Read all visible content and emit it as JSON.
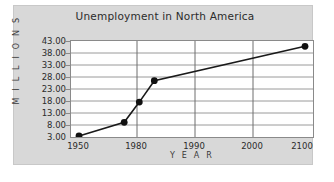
{
  "chart_data": {
    "type": "line",
    "title": "Unemployment in North America",
    "xlabel": "Y E A R",
    "ylabel": "M I L L I O N S",
    "x": [
      1950,
      1980,
      1990,
      2000,
      2100
    ],
    "xtick_labels": [
      "1950",
      "1980",
      "1990",
      "2000",
      "2100"
    ],
    "values": [
      3.2,
      9.0,
      17.5,
      26.5,
      41.0
    ],
    "ytick_labels": [
      "43.00",
      "38.00",
      "33.00",
      "28.00",
      "23.00",
      "18.00",
      "13.00",
      "8.00",
      "3.00"
    ],
    "yticks": [
      43.0,
      38.0,
      33.0,
      28.0,
      23.0,
      18.0,
      13.0,
      8.0,
      3.0
    ],
    "ylim": [
      3.0,
      43.0
    ],
    "grid": "horizontal-and-vertical",
    "legend": "none",
    "series_name": "Unemployment",
    "line_color": "#1a1a1a",
    "marker": "circle",
    "marker_color": "#111111",
    "background_color": "#d8d8d8",
    "plot_background_color": "#ffffff",
    "gridline_color": "#9a9a9a"
  }
}
